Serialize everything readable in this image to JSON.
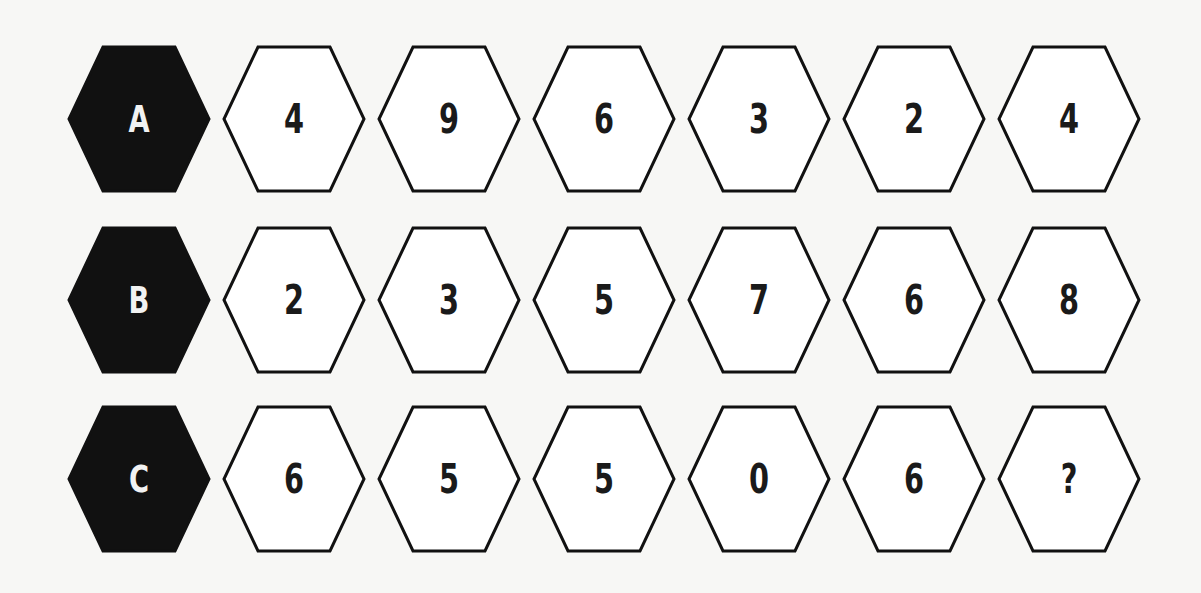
{
  "puzzle": {
    "rows": [
      {
        "label": "A",
        "values": [
          "4",
          "9",
          "6",
          "3",
          "2",
          "4"
        ]
      },
      {
        "label": "B",
        "values": [
          "2",
          "3",
          "5",
          "7",
          "6",
          "8"
        ]
      },
      {
        "label": "C",
        "values": [
          "6",
          "5",
          "5",
          "0",
          "6",
          "?"
        ]
      }
    ]
  },
  "colors": {
    "label_fill": "#111111",
    "cell_fill": "#ffffff",
    "stroke": "#111111",
    "background": "#f7f7f5"
  }
}
